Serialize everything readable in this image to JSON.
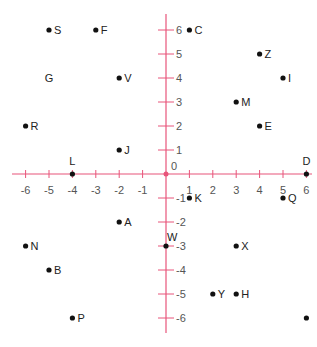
{
  "chart_data": {
    "type": "scatter",
    "title": "",
    "xlabel": "",
    "ylabel": "",
    "xlim": [
      -6,
      6
    ],
    "ylim": [
      -6,
      6
    ],
    "grid": false,
    "axis_color": "#e8547a",
    "point_color": "#111111",
    "origin_label": "0",
    "x_ticks": [
      -6,
      -5,
      -4,
      -3,
      -2,
      -1,
      1,
      2,
      3,
      4,
      5,
      6
    ],
    "y_ticks": [
      -6,
      -5,
      -4,
      -3,
      -2,
      -1,
      1,
      2,
      3,
      4,
      5,
      6
    ],
    "points": [
      {
        "label": "S",
        "x": -5,
        "y": 6,
        "dot": true,
        "pos": "right"
      },
      {
        "label": "F",
        "x": -3,
        "y": 6,
        "dot": true,
        "pos": "right"
      },
      {
        "label": "C",
        "x": 1,
        "y": 6,
        "dot": true,
        "pos": "right"
      },
      {
        "label": "Z",
        "x": 4,
        "y": 5,
        "dot": true,
        "pos": "right"
      },
      {
        "label": "G",
        "x": -5,
        "y": 4,
        "dot": false,
        "pos": "center"
      },
      {
        "label": "V",
        "x": -2,
        "y": 4,
        "dot": true,
        "pos": "right"
      },
      {
        "label": "I",
        "x": 5,
        "y": 4,
        "dot": true,
        "pos": "right"
      },
      {
        "label": "M",
        "x": 3,
        "y": 3,
        "dot": true,
        "pos": "right"
      },
      {
        "label": "R",
        "x": -6,
        "y": 2,
        "dot": true,
        "pos": "right"
      },
      {
        "label": "E",
        "x": 4,
        "y": 2,
        "dot": true,
        "pos": "right"
      },
      {
        "label": "J",
        "x": -2,
        "y": 1,
        "dot": true,
        "pos": "right"
      },
      {
        "label": "L",
        "x": -4,
        "y": 0,
        "dot": true,
        "pos": "above"
      },
      {
        "label": "D",
        "x": 6,
        "y": 0,
        "dot": true,
        "pos": "above"
      },
      {
        "label": "K",
        "x": 1,
        "y": -1,
        "dot": true,
        "pos": "right"
      },
      {
        "label": "Q",
        "x": 5,
        "y": -1,
        "dot": true,
        "pos": "right"
      },
      {
        "label": "A",
        "x": -2,
        "y": -2,
        "dot": true,
        "pos": "right"
      },
      {
        "label": "N",
        "x": -6,
        "y": -3,
        "dot": true,
        "pos": "right"
      },
      {
        "label": "W",
        "x": 0,
        "y": -3,
        "dot": true,
        "pos": "above-right"
      },
      {
        "label": "X",
        "x": 3,
        "y": -3,
        "dot": true,
        "pos": "right"
      },
      {
        "label": "B",
        "x": -5,
        "y": -4,
        "dot": true,
        "pos": "right"
      },
      {
        "label": "Y",
        "x": 2,
        "y": -5,
        "dot": true,
        "pos": "right"
      },
      {
        "label": "H",
        "x": 3,
        "y": -5,
        "dot": true,
        "pos": "right"
      },
      {
        "label": "P",
        "x": -4,
        "y": -6,
        "dot": true,
        "pos": "right"
      },
      {
        "label": "",
        "x": 6,
        "y": -6,
        "dot": true,
        "pos": "right"
      }
    ]
  }
}
